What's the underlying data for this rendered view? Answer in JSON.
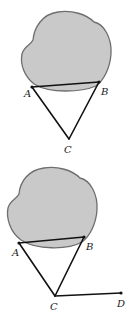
{
  "figures": [
    {
      "id": "top",
      "points": {
        "A": {
          "label": "A",
          "x": 32,
          "y": 87
        },
        "B": {
          "label": "B",
          "x": 99,
          "y": 82
        },
        "C": {
          "label": "C",
          "x": 69,
          "y": 139
        }
      },
      "segments": [
        "AB",
        "AC",
        "BC"
      ]
    },
    {
      "id": "bottom",
      "points": {
        "A": {
          "label": "A",
          "x": 19,
          "y": 243
        },
        "B": {
          "label": "B",
          "x": 84,
          "y": 237
        },
        "C": {
          "label": "C",
          "x": 55,
          "y": 296
        },
        "D": {
          "label": "D",
          "x": 121,
          "y": 293
        }
      },
      "segments": [
        "AB",
        "AC",
        "BC",
        "CD"
      ]
    }
  ],
  "colors": {
    "region_fill": "#c9c9c9",
    "region_stroke": "#6e6e6e",
    "line": "#111111"
  }
}
